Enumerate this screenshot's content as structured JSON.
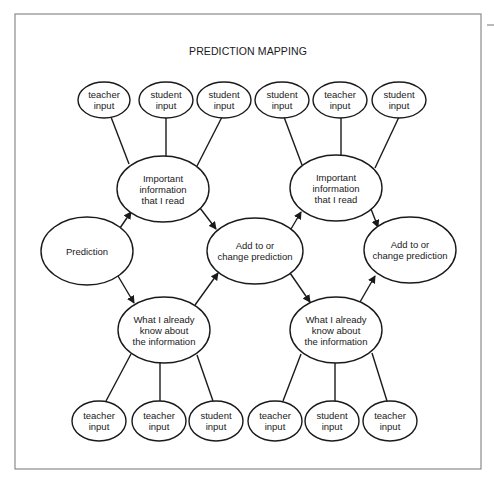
{
  "title": "PREDICTION MAPPING",
  "colors": {
    "stroke": "#1a1a1a",
    "frame": "#8a8a8a",
    "background": "#ffffff"
  },
  "frame": {
    "x": 15,
    "y": 14,
    "w": 466,
    "h": 455
  },
  "corner_mark": {
    "x1": 487,
    "y1": 25,
    "x2": 494,
    "y2": 25
  },
  "nodes": [
    {
      "id": "t1",
      "lines": [
        "teacher",
        "input"
      ],
      "cx": 104,
      "cy": 100,
      "rx": 26,
      "ry": 18
    },
    {
      "id": "t2",
      "lines": [
        "student",
        "input"
      ],
      "cx": 166,
      "cy": 100,
      "rx": 27,
      "ry": 18
    },
    {
      "id": "t3",
      "lines": [
        "student",
        "input"
      ],
      "cx": 224,
      "cy": 100,
      "rx": 27,
      "ry": 18
    },
    {
      "id": "t4",
      "lines": [
        "student",
        "input"
      ],
      "cx": 282,
      "cy": 100,
      "rx": 27,
      "ry": 18
    },
    {
      "id": "t5",
      "lines": [
        "teacher",
        "input"
      ],
      "cx": 340,
      "cy": 100,
      "rx": 27,
      "ry": 18
    },
    {
      "id": "t6",
      "lines": [
        "student",
        "input"
      ],
      "cx": 399,
      "cy": 100,
      "rx": 27,
      "ry": 18
    },
    {
      "id": "imp1",
      "lines": [
        "Important",
        "information",
        "that I read"
      ],
      "cx": 163,
      "cy": 189,
      "rx": 46,
      "ry": 33
    },
    {
      "id": "imp2",
      "lines": [
        "Important",
        "information",
        "that I read"
      ],
      "cx": 336,
      "cy": 188,
      "rx": 46,
      "ry": 33
    },
    {
      "id": "pred",
      "lines": [
        "Prediction"
      ],
      "cx": 87,
      "cy": 251,
      "rx": 46,
      "ry": 34
    },
    {
      "id": "add1",
      "lines": [
        "Add to or",
        "change prediction"
      ],
      "cx": 255,
      "cy": 251,
      "rx": 48,
      "ry": 33
    },
    {
      "id": "add2",
      "lines": [
        "Add to or",
        "change prediction"
      ],
      "cx": 410,
      "cy": 250,
      "rx": 46,
      "ry": 33
    },
    {
      "id": "know1",
      "lines": [
        "What I already",
        "know about",
        "the information"
      ],
      "cx": 164,
      "cy": 330,
      "rx": 46,
      "ry": 33
    },
    {
      "id": "know2",
      "lines": [
        "What I already",
        "know about",
        "the information"
      ],
      "cx": 336,
      "cy": 330,
      "rx": 46,
      "ry": 33
    },
    {
      "id": "b1",
      "lines": [
        "teacher",
        "input"
      ],
      "cx": 99,
      "cy": 421,
      "rx": 27,
      "ry": 20
    },
    {
      "id": "b2",
      "lines": [
        "teacher",
        "input"
      ],
      "cx": 159,
      "cy": 421,
      "rx": 27,
      "ry": 20
    },
    {
      "id": "b3",
      "lines": [
        "student",
        "input"
      ],
      "cx": 216,
      "cy": 421,
      "rx": 27,
      "ry": 20
    },
    {
      "id": "b4",
      "lines": [
        "teacher",
        "input"
      ],
      "cx": 275,
      "cy": 421,
      "rx": 27,
      "ry": 20
    },
    {
      "id": "b5",
      "lines": [
        "student",
        "input"
      ],
      "cx": 332,
      "cy": 421,
      "rx": 27,
      "ry": 20
    },
    {
      "id": "b6",
      "lines": [
        "teacher",
        "input"
      ],
      "cx": 390,
      "cy": 421,
      "rx": 27,
      "ry": 20
    }
  ],
  "edges": [
    {
      "from": "t1",
      "to": "imp1",
      "x1": 111,
      "y1": 117,
      "x2": 129,
      "y2": 164,
      "arrow": false
    },
    {
      "from": "t2",
      "to": "imp1",
      "x1": 166,
      "y1": 118,
      "x2": 166,
      "y2": 156,
      "arrow": false
    },
    {
      "from": "t3",
      "to": "imp1",
      "x1": 222,
      "y1": 117,
      "x2": 197,
      "y2": 166,
      "arrow": false
    },
    {
      "from": "t4",
      "to": "imp2",
      "x1": 284,
      "y1": 117,
      "x2": 302,
      "y2": 165,
      "arrow": false
    },
    {
      "from": "t5",
      "to": "imp2",
      "x1": 341,
      "y1": 118,
      "x2": 341,
      "y2": 155,
      "arrow": false
    },
    {
      "from": "t6",
      "to": "imp2",
      "x1": 399,
      "y1": 117,
      "x2": 375,
      "y2": 168,
      "arrow": false
    },
    {
      "from": "pred",
      "to": "imp1",
      "x1": 120,
      "y1": 228,
      "x2": 131,
      "y2": 212,
      "arrow": true
    },
    {
      "from": "imp1",
      "to": "add1",
      "x1": 200,
      "y1": 208,
      "x2": 216,
      "y2": 229,
      "arrow": true
    },
    {
      "from": "pred",
      "to": "know1",
      "x1": 118,
      "y1": 276,
      "x2": 134,
      "y2": 303,
      "arrow": true
    },
    {
      "from": "know1",
      "to": "add1",
      "x1": 195,
      "y1": 305,
      "x2": 218,
      "y2": 273,
      "arrow": true
    },
    {
      "from": "add1",
      "to": "imp2",
      "x1": 291,
      "y1": 229,
      "x2": 301,
      "y2": 212,
      "arrow": true
    },
    {
      "from": "imp2",
      "to": "add2",
      "x1": 371,
      "y1": 209,
      "x2": 378,
      "y2": 227,
      "arrow": true
    },
    {
      "from": "add1",
      "to": "know2",
      "x1": 290,
      "y1": 273,
      "x2": 310,
      "y2": 302,
      "arrow": true
    },
    {
      "from": "know2",
      "to": "add2",
      "x1": 360,
      "y1": 302,
      "x2": 375,
      "y2": 276,
      "arrow": true
    },
    {
      "from": "know1",
      "to": "b1",
      "x1": 131,
      "y1": 354,
      "x2": 106,
      "y2": 401,
      "arrow": false
    },
    {
      "from": "know1",
      "to": "b2",
      "x1": 160,
      "y1": 363,
      "x2": 160,
      "y2": 401,
      "arrow": false
    },
    {
      "from": "know1",
      "to": "b3",
      "x1": 197,
      "y1": 355,
      "x2": 213,
      "y2": 401,
      "arrow": false
    },
    {
      "from": "know2",
      "to": "b4",
      "x1": 301,
      "y1": 354,
      "x2": 283,
      "y2": 401,
      "arrow": false
    },
    {
      "from": "know2",
      "to": "b5",
      "x1": 335,
      "y1": 363,
      "x2": 335,
      "y2": 401,
      "arrow": false
    },
    {
      "from": "know2",
      "to": "b6",
      "x1": 372,
      "y1": 353,
      "x2": 387,
      "y2": 401,
      "arrow": false
    }
  ]
}
